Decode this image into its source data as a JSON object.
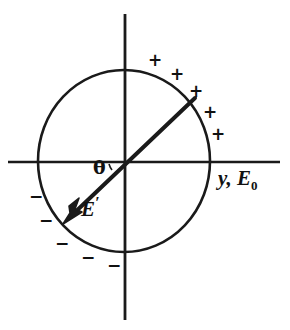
{
  "figure": {
    "background_color": "#ffffff",
    "stroke_color": "#1a1a1a"
  },
  "axes": {
    "horizontal": {
      "name": "horizontal-axis",
      "x1": 8,
      "y1": 162,
      "x2": 280,
      "y2": 162,
      "label": "y, E",
      "label_subscript": "0",
      "label_full": "y, E0"
    },
    "vertical": {
      "name": "vertical-axis",
      "x1": 125,
      "y1": 14,
      "x2": 125,
      "y2": 320
    },
    "origin": {
      "x": 125,
      "y": 162
    }
  },
  "circle": {
    "name": "sphere-outline",
    "cx": 124,
    "cy": 161,
    "rx": 86,
    "ry": 91
  },
  "vector": {
    "name": "e-prime-vector",
    "label": "E",
    "label_prime": "′",
    "tail": {
      "x": 195,
      "y": 98
    },
    "head": {
      "x": 65,
      "y": 222
    },
    "origin": {
      "x": 125,
      "y": 162
    }
  },
  "angle": {
    "name": "theta-angle",
    "label": "θ",
    "degrees_visual": 135
  },
  "charges": {
    "positive_label": "+",
    "negative_label": "−",
    "positive": [
      {
        "x": 148,
        "y": 52
      },
      {
        "x": 170,
        "y": 66
      },
      {
        "x": 189,
        "y": 83
      },
      {
        "x": 203,
        "y": 104
      },
      {
        "x": 211,
        "y": 126
      }
    ],
    "negative": [
      {
        "x": 29,
        "y": 188
      },
      {
        "x": 39,
        "y": 212
      },
      {
        "x": 55,
        "y": 235
      },
      {
        "x": 81,
        "y": 249
      },
      {
        "x": 107,
        "y": 257
      }
    ]
  }
}
